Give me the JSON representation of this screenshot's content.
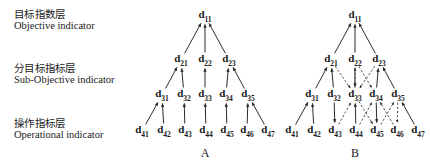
{
  "layer_labels": [
    {
      "id": "objective",
      "cn": "目标指数层",
      "en": "Objective indicator"
    },
    {
      "id": "sub",
      "cn": "分目标指标层",
      "en": "Sub-Objective indicator"
    },
    {
      "id": "operational",
      "cn": "操作指标层",
      "en": "Operational indicator"
    }
  ],
  "colors": {
    "ink": "#1a1a1a",
    "background": "#ffffff",
    "stroke": "#2b2b2b"
  },
  "diagrams": [
    {
      "id": "a",
      "caption": "A",
      "caption_pos": {
        "x": 75,
        "y": 153
      },
      "nodes": [
        {
          "id": "d11",
          "base": "d",
          "sub": "11",
          "x": 75,
          "y": 16
        },
        {
          "id": "d21",
          "base": "d",
          "sub": "21",
          "x": 51,
          "y": 60
        },
        {
          "id": "d22",
          "base": "d",
          "sub": "22",
          "x": 75,
          "y": 60
        },
        {
          "id": "d23",
          "base": "d",
          "sub": "23",
          "x": 99,
          "y": 60
        },
        {
          "id": "d31",
          "base": "d",
          "sub": "31",
          "x": 32,
          "y": 95
        },
        {
          "id": "d32",
          "base": "d",
          "sub": "32",
          "x": 54,
          "y": 95
        },
        {
          "id": "d33",
          "base": "d",
          "sub": "33",
          "x": 75,
          "y": 95
        },
        {
          "id": "d34",
          "base": "d",
          "sub": "34",
          "x": 96,
          "y": 95
        },
        {
          "id": "d35",
          "base": "d",
          "sub": "35",
          "x": 118,
          "y": 95
        },
        {
          "id": "d41",
          "base": "d",
          "sub": "41",
          "x": 12,
          "y": 131
        },
        {
          "id": "d42",
          "base": "d",
          "sub": "42",
          "x": 34,
          "y": 131
        },
        {
          "id": "d43",
          "base": "d",
          "sub": "43",
          "x": 55,
          "y": 131
        },
        {
          "id": "d44",
          "base": "d",
          "sub": "44",
          "x": 76,
          "y": 131
        },
        {
          "id": "d45",
          "base": "d",
          "sub": "45",
          "x": 97,
          "y": 131
        },
        {
          "id": "d46",
          "base": "d",
          "sub": "46",
          "x": 117,
          "y": 131
        },
        {
          "id": "d47",
          "base": "d",
          "sub": "47",
          "x": 138,
          "y": 131
        }
      ],
      "edges": [
        {
          "from": "d21",
          "to": "d11",
          "style": "solid",
          "arrow": "up"
        },
        {
          "from": "d22",
          "to": "d11",
          "style": "solid",
          "arrow": "up"
        },
        {
          "from": "d23",
          "to": "d11",
          "style": "solid",
          "arrow": "up"
        },
        {
          "from": "d31",
          "to": "d21",
          "style": "solid",
          "arrow": "up"
        },
        {
          "from": "d32",
          "to": "d21",
          "style": "solid",
          "arrow": "up"
        },
        {
          "from": "d33",
          "to": "d22",
          "style": "solid",
          "arrow": "up"
        },
        {
          "from": "d34",
          "to": "d23",
          "style": "solid",
          "arrow": "up"
        },
        {
          "from": "d35",
          "to": "d23",
          "style": "solid",
          "arrow": "up"
        },
        {
          "from": "d41",
          "to": "d31",
          "style": "solid",
          "arrow": "up"
        },
        {
          "from": "d42",
          "to": "d31",
          "style": "solid",
          "arrow": "up"
        },
        {
          "from": "d43",
          "to": "d32",
          "style": "solid",
          "arrow": "up"
        },
        {
          "from": "d44",
          "to": "d33",
          "style": "solid",
          "arrow": "up"
        },
        {
          "from": "d45",
          "to": "d34",
          "style": "solid",
          "arrow": "up"
        },
        {
          "from": "d46",
          "to": "d35",
          "style": "solid",
          "arrow": "up"
        },
        {
          "from": "d47",
          "to": "d35",
          "style": "solid",
          "arrow": "up"
        }
      ]
    },
    {
      "id": "b",
      "caption": "B",
      "caption_pos": {
        "x": 75,
        "y": 153
      },
      "nodes": [
        {
          "id": "d11",
          "base": "d",
          "sub": "11",
          "x": 75,
          "y": 16
        },
        {
          "id": "d21",
          "base": "d",
          "sub": "21",
          "x": 51,
          "y": 60
        },
        {
          "id": "d22",
          "base": "d",
          "sub": "22",
          "x": 75,
          "y": 60
        },
        {
          "id": "d23",
          "base": "d",
          "sub": "23",
          "x": 99,
          "y": 60
        },
        {
          "id": "d31",
          "base": "d",
          "sub": "31",
          "x": 32,
          "y": 95
        },
        {
          "id": "d32",
          "base": "d",
          "sub": "32",
          "x": 54,
          "y": 95
        },
        {
          "id": "d33",
          "base": "d",
          "sub": "33",
          "x": 75,
          "y": 95
        },
        {
          "id": "d34",
          "base": "d",
          "sub": "34",
          "x": 96,
          "y": 95
        },
        {
          "id": "d35",
          "base": "d",
          "sub": "35",
          "x": 118,
          "y": 95
        },
        {
          "id": "d41",
          "base": "d",
          "sub": "41",
          "x": 12,
          "y": 131
        },
        {
          "id": "d42",
          "base": "d",
          "sub": "42",
          "x": 34,
          "y": 131
        },
        {
          "id": "d43",
          "base": "d",
          "sub": "43",
          "x": 55,
          "y": 131
        },
        {
          "id": "d44",
          "base": "d",
          "sub": "44",
          "x": 76,
          "y": 131
        },
        {
          "id": "d45",
          "base": "d",
          "sub": "45",
          "x": 97,
          "y": 131
        },
        {
          "id": "d46",
          "base": "d",
          "sub": "46",
          "x": 117,
          "y": 131
        },
        {
          "id": "d47",
          "base": "d",
          "sub": "47",
          "x": 138,
          "y": 131
        }
      ],
      "edges": [
        {
          "from": "d21",
          "to": "d11",
          "style": "solid",
          "arrow": "up"
        },
        {
          "from": "d22",
          "to": "d11",
          "style": "solid",
          "arrow": "up"
        },
        {
          "from": "d23",
          "to": "d11",
          "style": "solid",
          "arrow": "up"
        },
        {
          "from": "d31",
          "to": "d21",
          "style": "solid",
          "arrow": "up"
        },
        {
          "from": "d32",
          "to": "d21",
          "style": "solid",
          "arrow": "up"
        },
        {
          "from": "d22",
          "to": "d33",
          "style": "solid",
          "arrow": "down"
        },
        {
          "from": "d34",
          "to": "d23",
          "style": "solid",
          "arrow": "up"
        },
        {
          "from": "d35",
          "to": "d23",
          "style": "solid",
          "arrow": "up"
        },
        {
          "from": "d21",
          "to": "d33",
          "style": "dashed",
          "arrow": "down"
        },
        {
          "from": "d33",
          "to": "d22",
          "style": "dashed",
          "arrow": "up"
        },
        {
          "from": "d22",
          "to": "d34",
          "style": "dashed",
          "arrow": "down"
        },
        {
          "from": "d23",
          "to": "d33",
          "style": "dashed",
          "arrow": "down"
        },
        {
          "from": "d32",
          "to": "d43",
          "style": "solid",
          "arrow": "down"
        },
        {
          "from": "d41",
          "to": "d31",
          "style": "solid",
          "arrow": "up"
        },
        {
          "from": "d42",
          "to": "d31",
          "style": "solid",
          "arrow": "up"
        },
        {
          "from": "d44",
          "to": "d33",
          "style": "solid",
          "arrow": "up"
        },
        {
          "from": "d34",
          "to": "d45",
          "style": "solid",
          "arrow": "down"
        },
        {
          "from": "d47",
          "to": "d35",
          "style": "solid",
          "arrow": "up"
        },
        {
          "from": "d43",
          "to": "d33",
          "style": "dashed",
          "arrow": "up"
        },
        {
          "from": "d33",
          "to": "d45",
          "style": "dashed",
          "arrow": "down"
        },
        {
          "from": "d44",
          "to": "d34",
          "style": "dashed",
          "arrow": "up"
        },
        {
          "from": "d45",
          "to": "d35",
          "style": "dashed",
          "arrow": "up"
        },
        {
          "from": "d35",
          "to": "d46",
          "style": "dashed",
          "arrow": "down"
        },
        {
          "from": "d46",
          "to": "d34",
          "style": "dashed",
          "arrow": "up"
        }
      ]
    }
  ]
}
